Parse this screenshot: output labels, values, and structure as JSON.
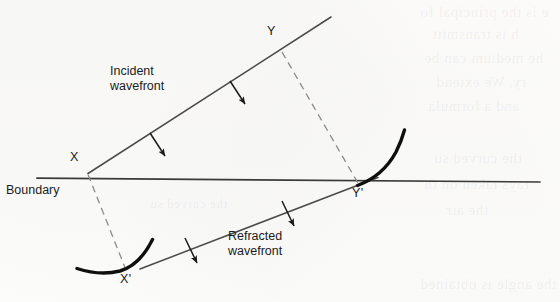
{
  "figure": {
    "background_color": "#fdfdfc",
    "ink_color": "#1b1b1b"
  },
  "labels": {
    "incident_line1": "Incident",
    "incident_line2": "wavefront",
    "refracted_line1": "Refracted",
    "refracted_line2": "wavefront",
    "boundary": "Boundary",
    "point_x": "X",
    "point_y": "Y",
    "point_x_prime": "X'",
    "point_y_prime": "Y'"
  },
  "bleed_through": {
    "line1": "e is the principal fo",
    "line2": "h is transmitt",
    "line3": "he medium can be",
    "line4": "ry. We extend",
    "line5": "and a formula",
    "line6": "the curved su",
    "line7": "rays taken on th",
    "line8": "the air",
    "line9": "the angle is obtained"
  },
  "geometry": {
    "boundary": {
      "x1": 37,
      "y1": 178,
      "x2": 540,
      "y2": 182
    },
    "incident_wavefront": {
      "x1": 88,
      "y1": 173,
      "x2": 331,
      "y2": 17
    },
    "refracted_wavefront": {
      "x1": 140,
      "y1": 269,
      "x2": 378,
      "y2": 178
    },
    "dashed_x_to_xprime": {
      "x1": 88,
      "y1": 174,
      "x2": 126,
      "y2": 270
    },
    "dashed_y_to_yprime": {
      "x1": 282,
      "y1": 52,
      "x2": 358,
      "y2": 183
    },
    "arc_at_yprime": {
      "start_x": 358,
      "start_y": 184,
      "end_x": 404,
      "end_y": 131
    },
    "arc_at_xprime": {
      "start_x": 78,
      "start_y": 268,
      "end_x": 152,
      "end_y": 240
    },
    "incident_arrows": [
      {
        "x": 158,
        "y": 148,
        "angle_deg": 57
      },
      {
        "x": 238,
        "y": 96,
        "angle_deg": 57
      }
    ],
    "refracted_arrows": [
      {
        "x": 192,
        "y": 254,
        "angle_deg": 69
      },
      {
        "x": 289,
        "y": 218,
        "angle_deg": 69
      }
    ]
  }
}
